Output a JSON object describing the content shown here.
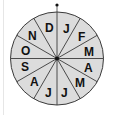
{
  "diagram": {
    "type": "month-wheel",
    "center": [
      57,
      58.5
    ],
    "radius": 46.5,
    "fill_color": "#dcdcdc",
    "stroke_color": "#3a3a3a",
    "marker": "top-dot",
    "segments_clockwise_from_top": [
      "J",
      "F",
      "M",
      "A",
      "M",
      "J",
      "J",
      "A",
      "S",
      "O",
      "N",
      "D"
    ]
  },
  "labels": {
    "s0": "J",
    "s1": "F",
    "s2": "M",
    "s3": "A",
    "s4": "M",
    "s5": "J",
    "s6": "J",
    "s7": "A",
    "s8": "S",
    "s9": "O",
    "s10": "N",
    "s11": "D"
  }
}
